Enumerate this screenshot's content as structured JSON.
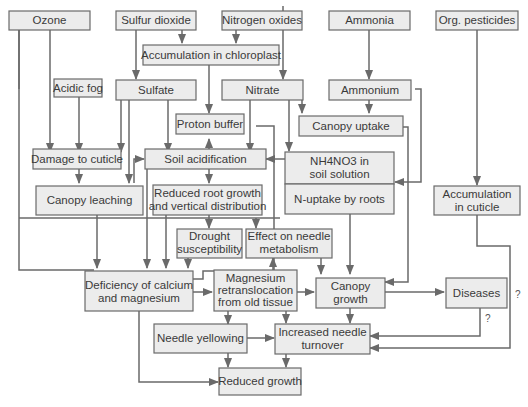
{
  "diagram": {
    "colors": {
      "box_fill": "#ececec",
      "box_stroke": "#6a6a6a",
      "line": "#6a6a6a",
      "text": "#3a3a3a"
    },
    "nodes": {
      "ozone": "Ozone",
      "sulfur_dioxide": "Sulfur dioxide",
      "nitrogen_oxides": "Nitrogen oxides",
      "ammonia": "Ammonia",
      "org_pesticides": "Org. pesticides",
      "accumulation_chloroplast": "Accumulation in chloroplast",
      "acidic_fog": "Acidic fog",
      "sulfate": "Sulfate",
      "nitrate": "Nitrate",
      "ammonium": "Ammonium",
      "proton_buffer": "Proton buffer",
      "canopy_uptake": "Canopy uptake",
      "damage_cuticle": "Damage to cuticle",
      "soil_acidification": "Soil acidification",
      "nh4no3_line1": "NH4NO3 in",
      "nh4no3_line2": "soil solution",
      "n_uptake": "N-uptake by roots",
      "canopy_leaching": "Canopy leaching",
      "reduced_root_line1": "Reduced root growth",
      "reduced_root_line2": "and vertical distribution",
      "accum_cuticle_line1": "Accumulation",
      "accum_cuticle_line2": "in cuticle",
      "drought_line1": "Drought",
      "drought_line2": "susceptibility",
      "needle_metab_line1": "Effect on needle",
      "needle_metab_line2": "metabolism",
      "deficiency_line1": "Deficiency of calcium",
      "deficiency_line2": "and magnesium",
      "mg_line1": "Magnesium",
      "mg_line2": "retranslocation",
      "mg_line3": "from old tissue",
      "canopy_growth_line1": "Canopy",
      "canopy_growth_line2": "growth",
      "diseases": "Diseases",
      "needle_yellowing": "Needle yellowing",
      "turnover_line1": "Increased needle",
      "turnover_line2": "turnover",
      "reduced_growth": "Reduced growth"
    },
    "annotations": {
      "uncertain_diseases": "?",
      "uncertain_pesticides": "?"
    }
  }
}
